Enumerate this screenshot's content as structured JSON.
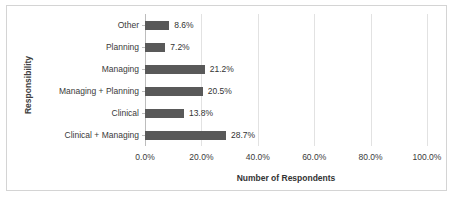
{
  "chart_data": {
    "type": "bar",
    "orientation": "horizontal",
    "title": "",
    "xlabel": "Number of Respondents",
    "ylabel": "Responsibility",
    "categories": [
      "Other",
      "Planning",
      "Managing",
      "Managing + Planning",
      "Clinical",
      "Clinical + Managing"
    ],
    "values": [
      8.6,
      7.2,
      21.2,
      20.5,
      13.8,
      28.7
    ],
    "data_labels": [
      "8.6%",
      "7.2%",
      "21.2%",
      "20.5%",
      "13.8%",
      "28.7%"
    ],
    "xlim": [
      0,
      100
    ],
    "x_tick_values": [
      0,
      20,
      40,
      60,
      80,
      100
    ],
    "x_tick_labels": [
      "0.0%",
      "20.0%",
      "40.0%",
      "60.0%",
      "80.0%",
      "100.0%"
    ],
    "grid": "vertical",
    "legend": "none",
    "bar_color": "#595959",
    "gridline_color": "#e2e2e2",
    "axis_color": "#bdbdbd",
    "frame_border_color": "#d4d4d4",
    "plot_background": "#ffffff"
  }
}
